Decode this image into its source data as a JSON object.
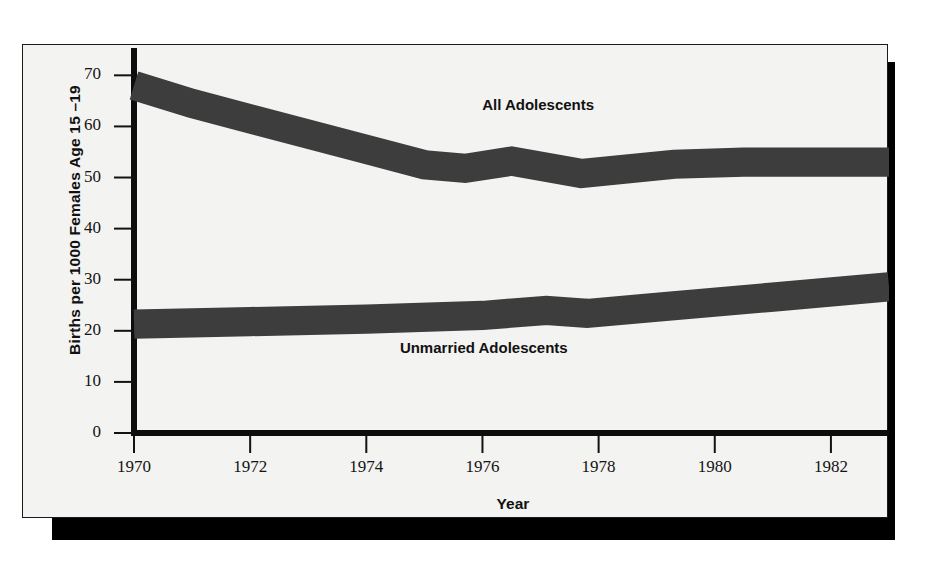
{
  "chart_data": {
    "type": "line",
    "title": "",
    "xlabel": "Year",
    "ylabel": "Births per 1000 Females Age 15 –19",
    "xlim": [
      1970,
      1983
    ],
    "ylim": [
      0,
      73
    ],
    "xticks": [
      1970,
      1972,
      1974,
      1976,
      1978,
      1980,
      1982
    ],
    "xtick_labels": [
      "1970",
      "1972",
      "1974",
      "1976",
      "1978",
      "1980",
      "1982"
    ],
    "yticks": [
      0,
      10,
      20,
      30,
      40,
      50,
      60,
      70
    ],
    "ytick_labels": [
      "0",
      "10",
      "20",
      "30",
      "40",
      "50",
      "60",
      "70"
    ],
    "grid": false,
    "legend_position": "inline-annotations",
    "line_color": "#3d3d3d",
    "line_width_units": 2.2,
    "series": [
      {
        "name": "All Adolescents",
        "label_x": 1977.2,
        "label_y": 64,
        "x": [
          1970,
          1971,
          1972,
          1973,
          1974,
          1975,
          1975.7,
          1976.5,
          1977.7,
          1979.3,
          1980.5,
          1983
        ],
        "values": [
          68.0,
          64.5,
          61.5,
          58.5,
          55.5,
          52.5,
          51.8,
          53.2,
          50.8,
          52.6,
          53.0,
          53.0
        ]
      },
      {
        "name": "Unmarried Adolescents",
        "label_x": 1976.3,
        "label_y": 16.5,
        "x": [
          1970,
          1972,
          1974,
          1976,
          1977.1,
          1977.8,
          1979,
          1981,
          1983
        ],
        "values": [
          21.3,
          21.8,
          22.3,
          23.0,
          24.0,
          23.4,
          24.6,
          26.6,
          28.6
        ]
      }
    ]
  },
  "annotations": {
    "all_adolescents": "All Adolescents",
    "unmarried_adolescents": "Unmarried Adolescents"
  }
}
